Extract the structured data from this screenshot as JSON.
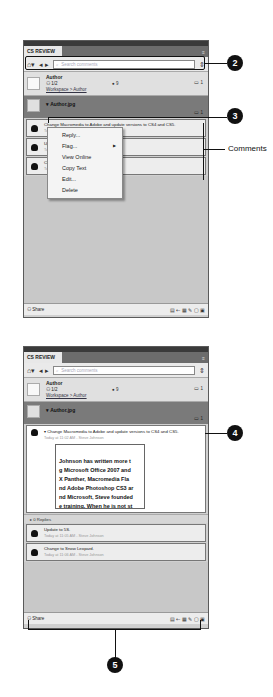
{
  "panel_top": {
    "tab_label": "CS REVIEW",
    "toolbar": {
      "home_icon": "⌂▾",
      "nav_icons": "◂ ▸",
      "search_placeholder": "Search comments",
      "scroll_icon": "⇕"
    },
    "author_row": {
      "name": "Author",
      "users": "1/2",
      "mid_count": "9",
      "comments": "1",
      "breadcrumb": "Workspace > Author"
    },
    "doc_row": {
      "title": "Author.jpg",
      "comments": "1"
    },
    "comments": [
      {
        "text": "Change Macromedia to Adobe and update versions to CS4 and CS5.",
        "meta": "Today at 11:02 AM - Steve Johnson"
      },
      {
        "text": "Update to 5S.",
        "meta": "Today at 11:05 AM - Steve Johnson"
      },
      {
        "text": "Change to Snow Leopard.",
        "meta": "Today at 11:06 AM - Steve Johnson"
      }
    ],
    "context_menu": [
      "Reply...",
      "Flag...",
      "View Online",
      "Copy Text",
      "Edit...",
      "Delete"
    ],
    "statusbar": {
      "share_label": "Share",
      "icons": "▤ ⇠ ▦ ✎ ▢ ▣"
    }
  },
  "panel_bottom": {
    "tab_label": "CS REVIEW",
    "toolbar": {
      "home_icon": "⌂▾",
      "nav_icons": "◂ ▸",
      "search_placeholder": "Search comments",
      "scroll_icon": "⇕"
    },
    "author_row": {
      "name": "Author",
      "users": "1/2",
      "mid_count": "9",
      "comments": "1",
      "breadcrumb": "Workspace > Author"
    },
    "doc_row": {
      "title": "Author.jpg",
      "comments": "1"
    },
    "expanded_comment": {
      "text": "Change Macromedia to Adobe and update versions to CS4 and CS5.",
      "meta": "Today at 11:02 AM - Steve Johnson",
      "preview_lines": [
        "Johnson has written more t",
        "g Microsoft Office 2007 and",
        "X Panther, Macromedia Fla",
        "nd Adobe Photoshop CS3 ar",
        "nd Microsoft, Steve founded",
        "e training. When he is not st"
      ],
      "replies": "0 Replies"
    },
    "comments": [
      {
        "text": "Update to 5S.",
        "meta": "Today at 11:05 AM - Steve Johnson"
      },
      {
        "text": "Change to Snow Leopard.",
        "meta": "Today at 11:06 AM - Steve Johnson"
      }
    ],
    "statusbar": {
      "share_label": "Share",
      "icons": "▤ ⇠ ▦ ✎ ▢ ▣"
    }
  },
  "callouts": {
    "c2": "2",
    "c3": "3",
    "c4": "4",
    "c5": "5",
    "comments_label": "Comments"
  }
}
